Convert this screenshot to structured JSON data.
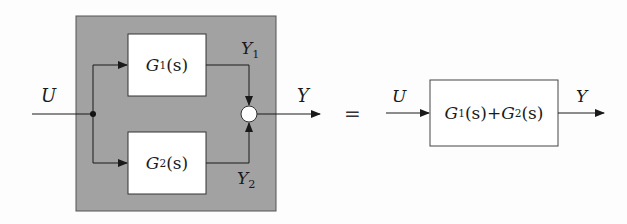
{
  "diagram": {
    "colors": {
      "shaded_region": "#a2a2a2",
      "block_fill": "#ffffff",
      "line": "#1a1a1a",
      "summing_fill": "#ffffff"
    },
    "left": {
      "input_label": "U",
      "output_label": "Y",
      "blocks": [
        {
          "id": "G1",
          "name": "G",
          "sub": "1",
          "arg": "(s)",
          "output_label": "Y",
          "output_sub": "1"
        },
        {
          "id": "G2",
          "name": "G",
          "sub": "2",
          "arg": "(s)",
          "output_label": "Y",
          "output_sub": "2"
        }
      ],
      "summing_junction": "sum",
      "branch_point": "dot"
    },
    "equals": "=",
    "right": {
      "input_label": "U",
      "output_label": "Y",
      "block": {
        "term1_name": "G",
        "term1_sub": "1",
        "term1_arg": "(s)",
        "operator": "+",
        "term2_name": "G",
        "term2_sub": "2",
        "term2_arg": "(s)"
      }
    }
  }
}
